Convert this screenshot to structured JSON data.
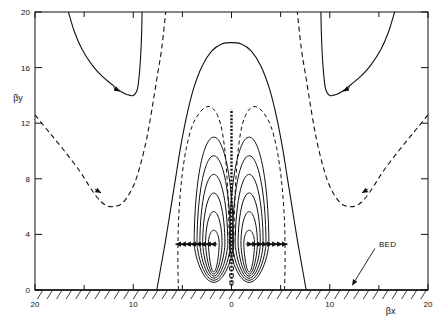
{
  "figure": {
    "background_color": "#ffffff",
    "line_color": "#111111",
    "frame": {
      "x0": 35,
      "y0": 12,
      "x1": 428,
      "y1": 290
    }
  },
  "chart_data": {
    "type": "line",
    "title": "",
    "subtitle": "",
    "xlabel": "βx",
    "ylabel": "βy",
    "xlim": [
      -20,
      20
    ],
    "ylim": [
      0,
      20
    ],
    "grid": false,
    "legend_position": "none",
    "x_tick_labels": [
      "20",
      "10",
      "0",
      "10",
      "20"
    ],
    "x_tick_values": [
      -20,
      -10,
      0,
      10,
      20
    ],
    "x_minor_tick_values": [
      -15,
      -5,
      5,
      15
    ],
    "y_tick_labels": [
      "0",
      "4",
      "8",
      "12",
      "16",
      "20"
    ],
    "y_tick_values": [
      0,
      4,
      8,
      12,
      16,
      20
    ],
    "annotations": [
      {
        "name": "bed-label",
        "text": "BED",
        "text_x": 15.0,
        "text_y": 3.1,
        "leader_to_x": 12.3,
        "leader_to_y": 0.35
      }
    ],
    "series": [
      {
        "name": "bed-surface",
        "style": "solid",
        "description": "horizontal bed line at βy = 0 with hatching below",
        "y_value": 0,
        "hatch": {
          "count": 41,
          "slant": "forward",
          "length": 9
        }
      },
      {
        "name": "outer-dashed-streamline-left",
        "style": "dashed",
        "description": "descends from βy≈12.6 at βx=-20 to minimum βy≈6 near βx=-13, then rises steeply toward the top frame near βx=-6",
        "points": [
          [
            -20.0,
            12.6
          ],
          [
            -18.5,
            11.3
          ],
          [
            -17.0,
            10.0
          ],
          [
            -15.5,
            8.6
          ],
          [
            -14.5,
            7.5
          ],
          [
            -13.6,
            6.6
          ],
          [
            -12.8,
            6.1
          ],
          [
            -12.0,
            6.0
          ],
          [
            -11.2,
            6.2
          ],
          [
            -10.5,
            6.8
          ],
          [
            -9.8,
            7.8
          ],
          [
            -9.2,
            9.2
          ],
          [
            -8.6,
            11.0
          ],
          [
            -8.1,
            13.0
          ],
          [
            -7.6,
            15.2
          ],
          [
            -7.1,
            17.4
          ],
          [
            -6.7,
            20.0
          ]
        ],
        "arrow_at": [
          -13.3,
          7.0
        ],
        "arrow_dir": "down-right"
      },
      {
        "name": "outer-dashed-streamline-right",
        "style": "dashed",
        "description": "mirror of outer-dashed-streamline-left",
        "points": [
          [
            20.0,
            12.6
          ],
          [
            18.5,
            11.3
          ],
          [
            17.0,
            10.0
          ],
          [
            15.5,
            8.6
          ],
          [
            14.5,
            7.5
          ],
          [
            13.6,
            6.6
          ],
          [
            12.8,
            6.1
          ],
          [
            12.0,
            6.0
          ],
          [
            11.2,
            6.2
          ],
          [
            10.5,
            6.8
          ],
          [
            9.8,
            7.8
          ],
          [
            9.2,
            9.2
          ],
          [
            8.6,
            11.0
          ],
          [
            8.1,
            13.0
          ],
          [
            7.6,
            15.2
          ],
          [
            7.1,
            17.4
          ],
          [
            6.7,
            20.0
          ]
        ],
        "arrow_at": [
          13.3,
          7.0
        ],
        "arrow_dir": "down-left"
      },
      {
        "name": "upper-solid-streamline-left",
        "style": "solid",
        "description": "U-shaped solid curve entering top frame near βx=-16.5, bottoming at βy≈14 near βx=-10, rising back to top near βx=-9",
        "points": [
          [
            -16.6,
            20.0
          ],
          [
            -16.0,
            18.6
          ],
          [
            -15.2,
            17.3
          ],
          [
            -14.2,
            16.2
          ],
          [
            -13.2,
            15.4
          ],
          [
            -12.2,
            14.8
          ],
          [
            -11.3,
            14.3
          ],
          [
            -10.6,
            14.05
          ],
          [
            -10.0,
            14.0
          ],
          [
            -9.6,
            14.4
          ],
          [
            -9.4,
            15.4
          ],
          [
            -9.25,
            16.8
          ],
          [
            -9.15,
            18.4
          ],
          [
            -9.1,
            20.0
          ]
        ],
        "arrow_at": [
          -11.4,
          14.3
        ],
        "arrow_dir": "down-right"
      },
      {
        "name": "upper-solid-streamline-right",
        "style": "solid",
        "description": "mirror of upper-solid-streamline-left",
        "points": [
          [
            16.6,
            20.0
          ],
          [
            16.0,
            18.6
          ],
          [
            15.2,
            17.3
          ],
          [
            14.2,
            16.2
          ],
          [
            13.2,
            15.4
          ],
          [
            12.2,
            14.8
          ],
          [
            11.3,
            14.3
          ],
          [
            10.6,
            14.05
          ],
          [
            10.0,
            14.0
          ],
          [
            9.6,
            14.4
          ],
          [
            9.4,
            15.4
          ],
          [
            9.25,
            16.8
          ],
          [
            9.15,
            18.4
          ],
          [
            9.1,
            20.0
          ]
        ],
        "arrow_at": [
          11.4,
          14.3
        ],
        "arrow_dir": "down-left"
      },
      {
        "name": "central-solid-dome",
        "style": "solid",
        "description": "large solid dome reaching βy≈17.8 at βx=0, legs meeting the bed at βx≈±7.6",
        "points": [
          [
            -7.6,
            0.0
          ],
          [
            -7.2,
            1.6
          ],
          [
            -6.7,
            3.6
          ],
          [
            -6.2,
            5.8
          ],
          [
            -5.7,
            8.0
          ],
          [
            -5.2,
            10.2
          ],
          [
            -4.6,
            12.4
          ],
          [
            -3.9,
            14.4
          ],
          [
            -3.0,
            16.1
          ],
          [
            -2.0,
            17.2
          ],
          [
            -1.0,
            17.7
          ],
          [
            0.0,
            17.8
          ],
          [
            1.0,
            17.7
          ],
          [
            2.0,
            17.2
          ],
          [
            3.0,
            16.1
          ],
          [
            3.9,
            14.4
          ],
          [
            4.6,
            12.4
          ],
          [
            5.2,
            10.2
          ],
          [
            5.7,
            8.0
          ],
          [
            6.2,
            5.8
          ],
          [
            6.7,
            3.6
          ],
          [
            7.2,
            1.6
          ],
          [
            7.6,
            0.0
          ]
        ]
      },
      {
        "name": "outer-cell-envelope-dashed",
        "style": "dashed",
        "description": "dashed envelope enclosing both recirculation cells, rising from bed near βx≈±5.4 up to about βy≈13 over each cell core",
        "points": [
          [
            -5.4,
            0.0
          ],
          [
            -5.45,
            1.6
          ],
          [
            -5.45,
            3.2
          ],
          [
            -5.4,
            4.8
          ],
          [
            -5.25,
            6.6
          ],
          [
            -5.0,
            8.4
          ],
          [
            -4.6,
            10.2
          ],
          [
            -4.0,
            11.8
          ],
          [
            -3.2,
            12.8
          ],
          [
            -2.4,
            13.2
          ],
          [
            -1.7,
            12.9
          ],
          [
            -1.1,
            11.9
          ],
          [
            -0.7,
            10.2
          ],
          [
            -0.45,
            8.0
          ],
          [
            -0.3,
            5.6
          ],
          [
            -0.22,
            3.2
          ],
          [
            -0.18,
            1.2
          ],
          [
            -0.15,
            0.2
          ]
        ],
        "mirrored": true
      },
      {
        "name": "vortex-core-contours-left",
        "style": "solid",
        "description": "six nested closed streamline contours around the left recirculation cell core at about (βx=-1.8, βy=3.3)",
        "contour_count": 6,
        "core_x": -1.8,
        "core_y": 3.3,
        "outermost_half_width": 2.0,
        "outermost_top_y": 11.0,
        "innermost_half_width": 0.55,
        "innermost_top_y": 4.3
      },
      {
        "name": "vortex-core-contours-right",
        "style": "solid",
        "description": "mirror of vortex-core-contours-left, core at about (βx=1.8, βy=3.3)",
        "contour_count": 6,
        "core_x": 1.8,
        "core_y": 3.3,
        "outermost_half_width": 2.0,
        "outermost_top_y": 11.0,
        "innermost_half_width": 0.55,
        "innermost_top_y": 4.3
      },
      {
        "name": "centerline-dashed",
        "style": "dashed",
        "description": "dense dashed vertical symmetry axis at βx=0 from bed up to βy≈13",
        "x_value": 0,
        "y_from": 0.3,
        "y_to": 13.0
      },
      {
        "name": "outflow-arrowheads",
        "style": "arrowheads",
        "description": "row of arrowheads at βy≈3.3 on each streamline, pointing outward (left on the left cell, right on the right cell)",
        "y_value": 3.3,
        "count_per_side": 8
      }
    ]
  }
}
